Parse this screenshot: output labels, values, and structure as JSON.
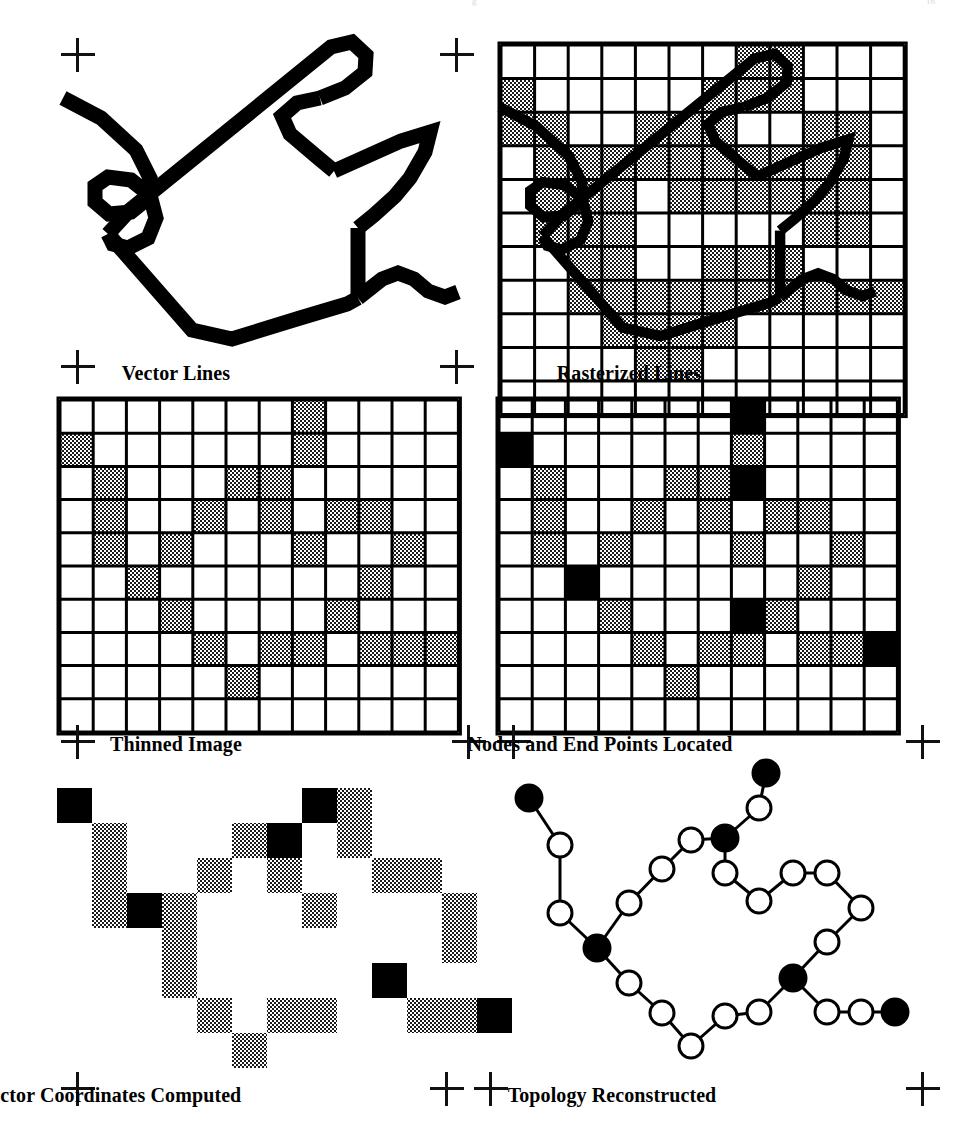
{
  "figure": {
    "background_color": "#ffffff",
    "ink_color": "#000000",
    "shade_color": "#4a4a4a",
    "panel_count": 6
  },
  "panels": [
    {
      "id": "vector-lines",
      "label": "Vector Lines",
      "label_x": 176,
      "label_y": 362
    },
    {
      "id": "rasterized-lines",
      "label": "Rasterized Lines",
      "label_x": 629,
      "label_y": 362
    },
    {
      "id": "thinned-image",
      "label": "Thinned Image",
      "label_x": 176,
      "label_y": 733
    },
    {
      "id": "nodes-endpoints",
      "label": "Nodes and End Points Located",
      "label_x": 600,
      "label_y": 733
    },
    {
      "id": "vector-coords",
      "label": "Vector Coordinates Computed",
      "label_x": 110,
      "label_y": 1084
    },
    {
      "id": "topology",
      "label": "Topology Reconstructed",
      "label_x": 612,
      "label_y": 1084
    }
  ],
  "registration_marks": [
    {
      "x": 61,
      "y": 38,
      "style": "full"
    },
    {
      "x": 440,
      "y": 38,
      "style": "full"
    },
    {
      "x": 61,
      "y": 350,
      "style": "full"
    },
    {
      "x": 440,
      "y": 350,
      "style": "full"
    },
    {
      "x": 61,
      "y": 725,
      "style": "full"
    },
    {
      "x": 452,
      "y": 725,
      "style": "full"
    },
    {
      "x": 497,
      "y": 725,
      "style": "full"
    },
    {
      "x": 906,
      "y": 725,
      "style": "full"
    },
    {
      "x": 61,
      "y": 1072,
      "style": "full"
    },
    {
      "x": 430,
      "y": 1072,
      "style": "full"
    },
    {
      "x": 474,
      "y": 1072,
      "style": "full"
    },
    {
      "x": 906,
      "y": 1072,
      "style": "full"
    }
  ],
  "vector_lines": {
    "stroke_width": 15,
    "paths": [
      "M 63,98 L 101,118 L 136,150 L 150,178 L 147,199 L 131,212 L 109,214 L 95,202 L 95,186 L 108,177 L 131,180 L 150,195 L 156,218 L 148,238 L 128,248 L 113,244 L 108,234",
      "M 108,234 L 192,330 L 232,339 L 300,318 L 347,304 L 358,298",
      "M 108,234 L 130,210 L 331,47 L 352,42 L 366,55 L 365,72 L 345,88 L 320,98",
      "M 320,98 L 297,103 L 282,116 L 290,134 L 316,156 L 334,171",
      "M 334,171 L 401,141 L 430,132 L 425,152 L 410,178 L 395,196 L 374,215 L 358,228",
      "M 358,228 L 358,298",
      "M 358,298 L 382,279 L 398,273 L 414,279 L 428,291 L 445,297 L 458,292"
    ]
  },
  "raster_grid": {
    "origin_x": 501,
    "origin_y": 45,
    "cell": 33.6,
    "cols": 12,
    "rows": 11,
    "border_width": 3,
    "shaded": [
      [
        0,
        7
      ],
      [
        0,
        8
      ],
      [
        1,
        0
      ],
      [
        1,
        6
      ],
      [
        1,
        7
      ],
      [
        1,
        8
      ],
      [
        2,
        0
      ],
      [
        2,
        1
      ],
      [
        2,
        4
      ],
      [
        2,
        5
      ],
      [
        2,
        6
      ],
      [
        2,
        9
      ],
      [
        2,
        10
      ],
      [
        3,
        1
      ],
      [
        3,
        2
      ],
      [
        3,
        3
      ],
      [
        3,
        4
      ],
      [
        3,
        5
      ],
      [
        3,
        6
      ],
      [
        3,
        7
      ],
      [
        3,
        8
      ],
      [
        3,
        9
      ],
      [
        3,
        10
      ],
      [
        4,
        1
      ],
      [
        4,
        2
      ],
      [
        4,
        3
      ],
      [
        4,
        5
      ],
      [
        4,
        6
      ],
      [
        4,
        7
      ],
      [
        4,
        8
      ],
      [
        4,
        9
      ],
      [
        4,
        10
      ],
      [
        5,
        1
      ],
      [
        5,
        2
      ],
      [
        5,
        3
      ],
      [
        5,
        9
      ],
      [
        5,
        10
      ],
      [
        6,
        2
      ],
      [
        6,
        3
      ],
      [
        6,
        6
      ],
      [
        6,
        7
      ],
      [
        6,
        8
      ],
      [
        7,
        2
      ],
      [
        7,
        3
      ],
      [
        7,
        4
      ],
      [
        7,
        5
      ],
      [
        7,
        6
      ],
      [
        7,
        7
      ],
      [
        7,
        8
      ],
      [
        7,
        9
      ],
      [
        7,
        10
      ],
      [
        7,
        11
      ],
      [
        8,
        3
      ],
      [
        8,
        4
      ],
      [
        8,
        5
      ],
      [
        8,
        6
      ],
      [
        9,
        4
      ],
      [
        9,
        5
      ]
    ]
  },
  "thinned_grid": {
    "origin_x": 60,
    "origin_y": 400,
    "cell": 33.2,
    "cols": 12,
    "rows": 10,
    "shaded": [
      [
        0,
        7
      ],
      [
        1,
        0
      ],
      [
        1,
        7
      ],
      [
        2,
        1
      ],
      [
        2,
        5
      ],
      [
        2,
        6
      ],
      [
        3,
        1
      ],
      [
        3,
        4
      ],
      [
        3,
        6
      ],
      [
        3,
        8
      ],
      [
        3,
        9
      ],
      [
        4,
        1
      ],
      [
        4,
        3
      ],
      [
        4,
        7
      ],
      [
        4,
        10
      ],
      [
        5,
        2
      ],
      [
        5,
        9
      ],
      [
        6,
        3
      ],
      [
        6,
        8
      ],
      [
        7,
        4
      ],
      [
        7,
        6
      ],
      [
        7,
        7
      ],
      [
        7,
        9
      ],
      [
        7,
        10
      ],
      [
        7,
        11
      ],
      [
        8,
        5
      ]
    ]
  },
  "nodes_grid": {
    "origin_x": 499,
    "origin_y": 400,
    "cell": 33.2,
    "cols": 12,
    "rows": 10,
    "shaded": [
      [
        1,
        7
      ],
      [
        2,
        1
      ],
      [
        2,
        5
      ],
      [
        2,
        6
      ],
      [
        3,
        1
      ],
      [
        3,
        4
      ],
      [
        3,
        6
      ],
      [
        3,
        8
      ],
      [
        3,
        9
      ],
      [
        4,
        1
      ],
      [
        4,
        3
      ],
      [
        4,
        7
      ],
      [
        4,
        10
      ],
      [
        5,
        9
      ],
      [
        6,
        3
      ],
      [
        6,
        8
      ],
      [
        7,
        4
      ],
      [
        7,
        6
      ],
      [
        7,
        7
      ],
      [
        7,
        9
      ],
      [
        7,
        10
      ],
      [
        8,
        5
      ]
    ],
    "solid": [
      [
        0,
        7
      ],
      [
        1,
        0
      ],
      [
        2,
        7
      ],
      [
        5,
        2
      ],
      [
        6,
        7
      ],
      [
        7,
        11
      ]
    ]
  },
  "vector_coords_grid": {
    "origin_x": 57,
    "origin_y": 788,
    "cell": 35.0,
    "cols": 12,
    "rows": 9,
    "shaded": [
      [
        0,
        8
      ],
      [
        1,
        1
      ],
      [
        1,
        5
      ],
      [
        1,
        8
      ],
      [
        2,
        1
      ],
      [
        2,
        4
      ],
      [
        2,
        6
      ],
      [
        2,
        9
      ],
      [
        2,
        10
      ],
      [
        3,
        1
      ],
      [
        3,
        3
      ],
      [
        3,
        7
      ],
      [
        3,
        11
      ],
      [
        4,
        3
      ],
      [
        4,
        11
      ],
      [
        5,
        3
      ],
      [
        6,
        4
      ],
      [
        6,
        6
      ],
      [
        6,
        7
      ],
      [
        6,
        10
      ],
      [
        6,
        11
      ],
      [
        7,
        5
      ]
    ],
    "solid": [
      [
        0,
        0
      ],
      [
        0,
        7
      ],
      [
        1,
        6
      ],
      [
        3,
        2
      ],
      [
        5,
        9
      ],
      [
        6,
        12
      ]
    ]
  },
  "topology": {
    "line_width": 3,
    "open_node_radius": 12,
    "solid_node_radius": 13,
    "nodes": [
      {
        "id": "e1",
        "x": 529,
        "y": 798,
        "type": "endpoint"
      },
      {
        "id": "o1",
        "x": 560,
        "y": 845,
        "type": "vertex"
      },
      {
        "id": "o2",
        "x": 560,
        "y": 913,
        "type": "vertex"
      },
      {
        "id": "n1",
        "x": 597,
        "y": 948,
        "type": "node"
      },
      {
        "id": "o3",
        "x": 629,
        "y": 983,
        "type": "vertex"
      },
      {
        "id": "o4",
        "x": 662,
        "y": 1013,
        "type": "vertex"
      },
      {
        "id": "o5",
        "x": 691,
        "y": 1046,
        "type": "vertex"
      },
      {
        "id": "o6",
        "x": 725,
        "y": 1016,
        "type": "vertex"
      },
      {
        "id": "o7",
        "x": 759,
        "y": 1012,
        "type": "vertex"
      },
      {
        "id": "n2",
        "x": 793,
        "y": 978,
        "type": "node"
      },
      {
        "id": "o8",
        "x": 827,
        "y": 1012,
        "type": "vertex"
      },
      {
        "id": "o9",
        "x": 861,
        "y": 1012,
        "type": "vertex"
      },
      {
        "id": "e2",
        "x": 895,
        "y": 1012,
        "type": "endpoint"
      },
      {
        "id": "o10",
        "x": 827,
        "y": 942,
        "type": "vertex"
      },
      {
        "id": "o11",
        "x": 861,
        "y": 908,
        "type": "vertex"
      },
      {
        "id": "o12",
        "x": 827,
        "y": 873,
        "type": "vertex"
      },
      {
        "id": "o13",
        "x": 793,
        "y": 873,
        "type": "vertex"
      },
      {
        "id": "o14",
        "x": 759,
        "y": 901,
        "type": "vertex"
      },
      {
        "id": "o15",
        "x": 725,
        "y": 873,
        "type": "vertex"
      },
      {
        "id": "n3",
        "x": 725,
        "y": 838,
        "type": "node"
      },
      {
        "id": "o16",
        "x": 759,
        "y": 808,
        "type": "vertex"
      },
      {
        "id": "e3",
        "x": 766,
        "y": 773,
        "type": "endpoint"
      },
      {
        "id": "o17",
        "x": 691,
        "y": 840,
        "type": "vertex"
      },
      {
        "id": "o18",
        "x": 662,
        "y": 869,
        "type": "vertex"
      },
      {
        "id": "o19",
        "x": 629,
        "y": 903,
        "type": "vertex"
      }
    ],
    "edges": [
      [
        "e1",
        "o1"
      ],
      [
        "o1",
        "o2"
      ],
      [
        "o2",
        "n1"
      ],
      [
        "n1",
        "o3"
      ],
      [
        "o3",
        "o4"
      ],
      [
        "o4",
        "o5"
      ],
      [
        "o5",
        "o6"
      ],
      [
        "o6",
        "o7"
      ],
      [
        "o7",
        "n2"
      ],
      [
        "n2",
        "o8"
      ],
      [
        "o8",
        "o9"
      ],
      [
        "o9",
        "e2"
      ],
      [
        "n2",
        "o10"
      ],
      [
        "o10",
        "o11"
      ],
      [
        "o11",
        "o12"
      ],
      [
        "o12",
        "o13"
      ],
      [
        "o13",
        "o14"
      ],
      [
        "o14",
        "o15"
      ],
      [
        "o15",
        "n3"
      ],
      [
        "n3",
        "o16"
      ],
      [
        "o16",
        "e3"
      ],
      [
        "n3",
        "o17"
      ],
      [
        "o17",
        "o18"
      ],
      [
        "o18",
        "o19"
      ],
      [
        "o19",
        "n1"
      ]
    ]
  },
  "top_bleed_text": {
    "center": "g",
    "right": "16"
  }
}
